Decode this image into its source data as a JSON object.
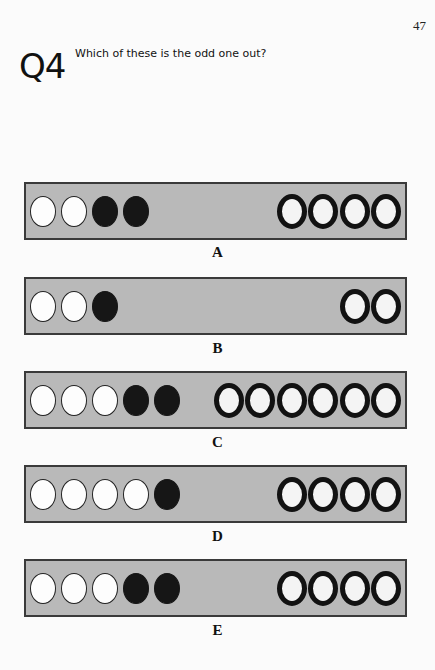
{
  "page": {
    "number": "47"
  },
  "question": {
    "number": "Q4",
    "text": "Which of these is the odd one out?"
  },
  "colors": {
    "panel_fill": "#b9b9b9",
    "panel_border": "#3a3a3a",
    "white_circle": "#fdfdfd",
    "black_circle": "#161616",
    "ring_outline": "#121212"
  },
  "options": [
    {
      "label": "A",
      "white": 2,
      "black": 2,
      "rings": 4
    },
    {
      "label": "B",
      "white": 2,
      "black": 1,
      "rings": 2
    },
    {
      "label": "C",
      "white": 3,
      "black": 2,
      "rings": 6
    },
    {
      "label": "D",
      "white": 4,
      "black": 1,
      "rings": 4
    },
    {
      "label": "E",
      "white": 3,
      "black": 2,
      "rings": 4
    }
  ]
}
